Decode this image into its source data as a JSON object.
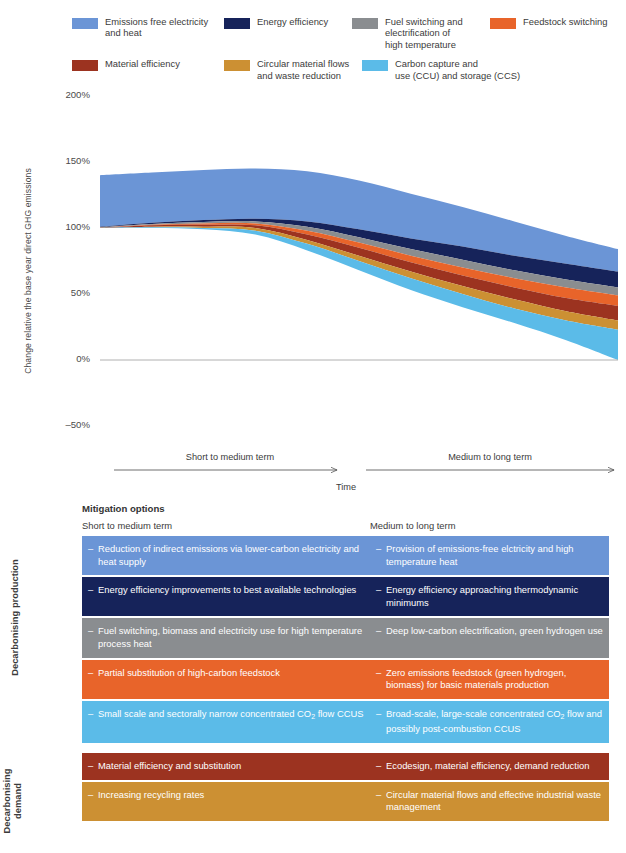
{
  "colors": {
    "emissions_free": "#6b95d6",
    "energy_efficiency": "#16235a",
    "fuel_switching": "#8a8d90",
    "feedstock_switching": "#e8642a",
    "material_efficiency": "#9c3320",
    "circular_flows": "#cc9033",
    "ccus": "#5bbbe8",
    "axis": "#b0b0b0",
    "text": "#3b3b3b"
  },
  "legend": {
    "rows": [
      [
        {
          "label": "Emissions free electricity\nand heat",
          "color_key": "emissions_free",
          "icon": "color-swatch"
        },
        {
          "label": "Energy efficiency",
          "color_key": "energy_efficiency",
          "icon": "color-swatch"
        },
        {
          "label": "Fuel switching and\nelectrification of\nhigh temperature",
          "color_key": "fuel_switching",
          "icon": "color-swatch"
        },
        {
          "label": "Feedstock switching",
          "color_key": "feedstock_switching",
          "icon": "color-swatch"
        }
      ],
      [
        {
          "label": "Material efficiency",
          "color_key": "material_efficiency",
          "icon": "color-swatch"
        },
        {
          "label": "Circular material flows\nand waste reduction",
          "color_key": "circular_flows",
          "icon": "color-swatch"
        },
        {
          "label": "Carbon capture and\nuse (CCU) and storage (CCS)",
          "color_key": "ccus",
          "icon": "color-swatch"
        }
      ]
    ]
  },
  "chart_data": {
    "type": "area",
    "title": "",
    "ylabel": "Change relative the base year direct GHG emissions",
    "xlabel": "Time",
    "ylim": [
      -50,
      200
    ],
    "yticks": [
      "200%",
      "150%",
      "100%",
      "50%",
      "0%",
      "–50%"
    ],
    "ytick_values": [
      200,
      150,
      100,
      50,
      0,
      -50
    ],
    "grid": false,
    "x": [
      0,
      10,
      20,
      30,
      40,
      50,
      60,
      70,
      80,
      90,
      100
    ],
    "xlabels": [
      "Short to medium term",
      "Medium to long term"
    ],
    "baseline_series_name": "Remaining direct GHG emissions",
    "note": "Stacked wedge diagram: top boundary is counterfactual emissions growth; each coloured band is abatement contributed by one mitigation option; bottom boundary is residual emissions.",
    "boundaries": {
      "top_counterfactual": [
        140,
        142,
        144,
        145,
        143,
        136,
        126,
        116,
        105,
        94,
        84
      ],
      "after_emissions_free": [
        101,
        104,
        106,
        107,
        105,
        99,
        92,
        86,
        79,
        73,
        67
      ],
      "after_energy_efficiency": [
        100.5,
        103,
        104.5,
        105,
        101,
        93,
        84,
        76,
        68,
        61,
        55
      ],
      "after_fuel_switching": [
        100.2,
        102.5,
        103.5,
        103.5,
        98,
        89,
        79,
        70,
        62,
        55,
        49
      ],
      "after_feedstock_switching": [
        100,
        102,
        102.5,
        102,
        95,
        85,
        74,
        64,
        55,
        47,
        41
      ],
      "after_material_efficiency": [
        100,
        101,
        101,
        100,
        91,
        79,
        67,
        56,
        46,
        37,
        30
      ],
      "after_circular_flows": [
        100,
        100.5,
        100,
        98,
        88,
        75,
        62,
        50,
        39,
        30,
        23
      ],
      "residual_after_ccus": [
        100,
        100,
        99,
        95,
        83,
        68,
        53,
        40,
        28,
        15,
        0
      ]
    },
    "series": [
      {
        "name": "Emissions free electricity and heat",
        "color_key": "emissions_free"
      },
      {
        "name": "Energy efficiency",
        "color_key": "energy_efficiency"
      },
      {
        "name": "Fuel switching and electrification of high temperature",
        "color_key": "fuel_switching"
      },
      {
        "name": "Feedstock switching",
        "color_key": "feedstock_switching"
      },
      {
        "name": "Material efficiency",
        "color_key": "material_efficiency"
      },
      {
        "name": "Circular material flows and waste reduction",
        "color_key": "circular_flows"
      },
      {
        "name": "Carbon capture and use (CCU) and storage (CCS)",
        "color_key": "ccus"
      }
    ]
  },
  "timeaxis": {
    "short_label": "Short to medium term",
    "long_label": "Medium to long term",
    "time_label": "Time"
  },
  "mitigation": {
    "title": "Mitigation options",
    "col_left": "Short to medium term",
    "col_right": "Medium to long term",
    "dash": "–",
    "side_labels": {
      "production": "Decarbonising production",
      "demand": "Decarbonising\ndemand"
    },
    "groups": [
      {
        "name": "production",
        "rows": [
          {
            "color_key": "emissions_free",
            "left": "Reduction of indirect emissions via lower-carbon electricity and heat supply",
            "right": "Provision of emissions-free elctricity and high temperature heat"
          },
          {
            "color_key": "energy_efficiency",
            "left": "Energy efficiency improvements to best available technologies",
            "right": "Energy efficiency approaching thermodynamic minimums"
          },
          {
            "color_key": "fuel_switching",
            "left": "Fuel switching, biomass and electricity use for high temperature process heat",
            "right": "Deep low-carbon electrification, green hydrogen use"
          },
          {
            "color_key": "feedstock_switching",
            "left": "Partial substitution of high-carbon feedstock",
            "right": "Zero emissions feedstock (green hydrogen, biomass) for basic materials production"
          },
          {
            "color_key": "ccus",
            "left": "Small scale and sectorally narrow concentrated CO2 flow CCUS",
            "right": "Broad-scale, large-scale concentrated CO2 flow and possibly post-combustion CCUS"
          }
        ]
      },
      {
        "name": "demand",
        "rows": [
          {
            "color_key": "material_efficiency",
            "left": "Material efficiency and substitution",
            "right": "Ecodesign, material efficiency, demand reduction"
          },
          {
            "color_key": "circular_flows",
            "left": "Increasing recycling rates",
            "right": "Circular material flows and effective industrial waste management"
          }
        ]
      }
    ]
  }
}
